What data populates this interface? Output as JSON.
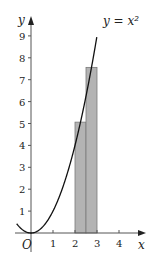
{
  "chart_data": {
    "type": "line",
    "title": "",
    "curve_label": "y = x²",
    "curve": "y = x^2",
    "xlabel": "x",
    "ylabel": "y",
    "origin_label": "O",
    "x_ticks": [
      "1",
      "2",
      "3",
      "4"
    ],
    "y_ticks": [
      "1",
      "2",
      "3",
      "4",
      "5",
      "6",
      "7",
      "8",
      "9"
    ],
    "xlim": [
      -0.5,
      5
    ],
    "ylim": [
      0,
      9.7
    ],
    "rectangles": [
      {
        "x_from": 2,
        "x_to": 2.5,
        "height": 5.0625,
        "label": "midpoint x=2.25"
      },
      {
        "x_from": 2.5,
        "x_to": 3,
        "height": 7.5625,
        "label": "midpoint x=2.75"
      }
    ],
    "colors": {
      "bars": "#b3b3b3",
      "bar_edge": "#7a7a7a",
      "curve": "#111111",
      "axes": "#555555"
    }
  }
}
